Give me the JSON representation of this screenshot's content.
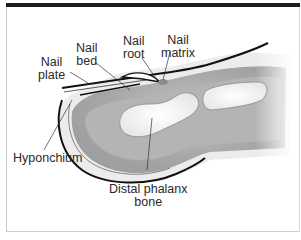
{
  "diagram": {
    "labels": {
      "nail_plate": [
        "Nail",
        "plate"
      ],
      "nail_bed": [
        "Nail",
        "bed"
      ],
      "nail_root": [
        "Nail",
        "root"
      ],
      "nail_matrix": [
        "Nail",
        "matrix"
      ],
      "hyponchium": [
        "Hyponchium"
      ],
      "distal_phalanx": [
        "Distal phalanx",
        "bone"
      ]
    },
    "colors": {
      "frame_top": "#1c1c1c",
      "outline": "#111111",
      "skin_light": "#ececec",
      "tissue_mid": "#a9a9a9",
      "tissue_dark": "#8f8f8f",
      "bone": "#f7f7f7",
      "leader_line": "#333333"
    }
  }
}
